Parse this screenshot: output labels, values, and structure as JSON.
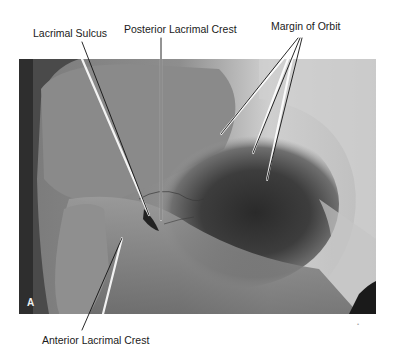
{
  "figure": {
    "panel_label": "A",
    "labels": {
      "lacrimal_sulcus": "Lacrimal Sulcus",
      "posterior_lacrimal_crest": "Posterior Lacrimal Crest",
      "margin_of_orbit": "Margin of Orbit",
      "anterior_lacrimal_crest": "Anterior Lacrimal Crest"
    },
    "corner_mark": "•"
  }
}
